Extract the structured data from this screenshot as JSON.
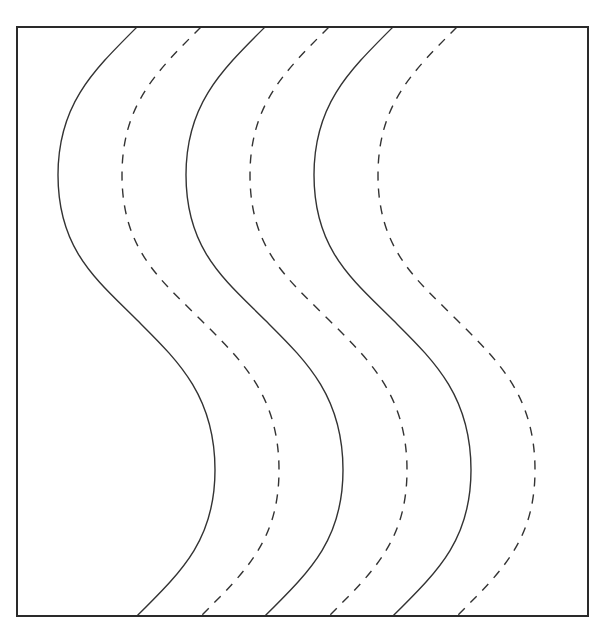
{
  "diagram": {
    "type": "wavy-lines-in-box",
    "frame": {
      "x": 17,
      "y": 27,
      "width": 571,
      "height": 589,
      "stroke": "#2a2a2a"
    },
    "wave": {
      "top_y": 27,
      "bottom_y": 616,
      "amplitude_left": 79,
      "amplitude_right": 78,
      "left_extreme_y": 175,
      "right_extreme_y": 470,
      "mid_y": 320
    },
    "lines": [
      {
        "id": "line-1",
        "style": "solid",
        "x_offset": 137
      },
      {
        "id": "line-2",
        "style": "dashed",
        "x_offset": 201
      },
      {
        "id": "line-3",
        "style": "solid",
        "x_offset": 265
      },
      {
        "id": "line-4",
        "style": "dashed",
        "x_offset": 329
      },
      {
        "id": "line-5",
        "style": "solid",
        "x_offset": 393
      },
      {
        "id": "line-6",
        "style": "dashed",
        "x_offset": 457
      }
    ],
    "line_color": "#333333"
  }
}
